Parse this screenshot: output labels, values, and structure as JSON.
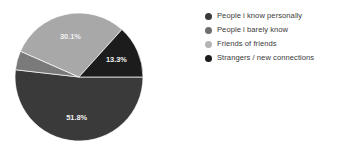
{
  "chart_data": {
    "type": "pie",
    "title": "",
    "subtitle": "",
    "xlabel": "",
    "ylabel": "",
    "grid": false,
    "legend_position": "right",
    "unit": "%",
    "categories": [
      "People i know personally",
      "People i barely know",
      "Friends of friends",
      "Strangers / new connections"
    ],
    "values": [
      51.8,
      4.8,
      30.1,
      13.3
    ],
    "slices": [
      {
        "label": "People i know personally",
        "value": 51.8,
        "data_label": "51.8%",
        "color": "#3a3a3a",
        "label_shown": true
      },
      {
        "label": "People i barely know",
        "value": 4.8,
        "data_label": "",
        "color": "#7a7a7a",
        "label_shown": false
      },
      {
        "label": "Friends of friends",
        "value": 30.1,
        "data_label": "30.1%",
        "color": "#a8a8a8",
        "label_shown": true
      },
      {
        "label": "Strangers / new connections",
        "value": 13.3,
        "data_label": "13.3%",
        "color": "#1c1c1c",
        "label_shown": true
      }
    ],
    "data_label_color": "#f2f2f2",
    "background_color": "#ffffff"
  },
  "legend": {
    "items": [
      {
        "label": "People i know personally",
        "color": "#3a3a3a"
      },
      {
        "label": "People i barely know",
        "color": "#6e6e6e"
      },
      {
        "label": "Friends of friends",
        "color": "#b4b4b4"
      },
      {
        "label": "Strangers / new connections",
        "color": "#1c1c1c"
      }
    ],
    "text_color": "#3b3b3b"
  }
}
